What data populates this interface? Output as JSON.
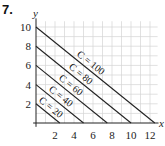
{
  "problem_number": "7.",
  "chart_data": {
    "type": "line",
    "title": "",
    "xlabel": "x",
    "ylabel": "y",
    "xlim": [
      0,
      12.8
    ],
    "ylim": [
      0,
      10.6
    ],
    "grid": true,
    "x_ticks": [
      2,
      4,
      6,
      8,
      10,
      12
    ],
    "y_ticks": [
      2,
      4,
      6,
      8,
      10
    ],
    "equation": "C = 8x + 10y",
    "series": [
      {
        "name": "C = 20",
        "points": [
          [
            0,
            2
          ],
          [
            2.5,
            0
          ]
        ]
      },
      {
        "name": "C = 40",
        "points": [
          [
            0,
            4
          ],
          [
            5,
            0
          ]
        ]
      },
      {
        "name": "C = 60",
        "points": [
          [
            0,
            6
          ],
          [
            7.5,
            0
          ]
        ]
      },
      {
        "name": "C = 80",
        "points": [
          [
            0,
            8
          ],
          [
            10,
            0
          ]
        ]
      },
      {
        "name": "C = 100",
        "points": [
          [
            0,
            10
          ],
          [
            12.5,
            0
          ]
        ]
      }
    ]
  }
}
